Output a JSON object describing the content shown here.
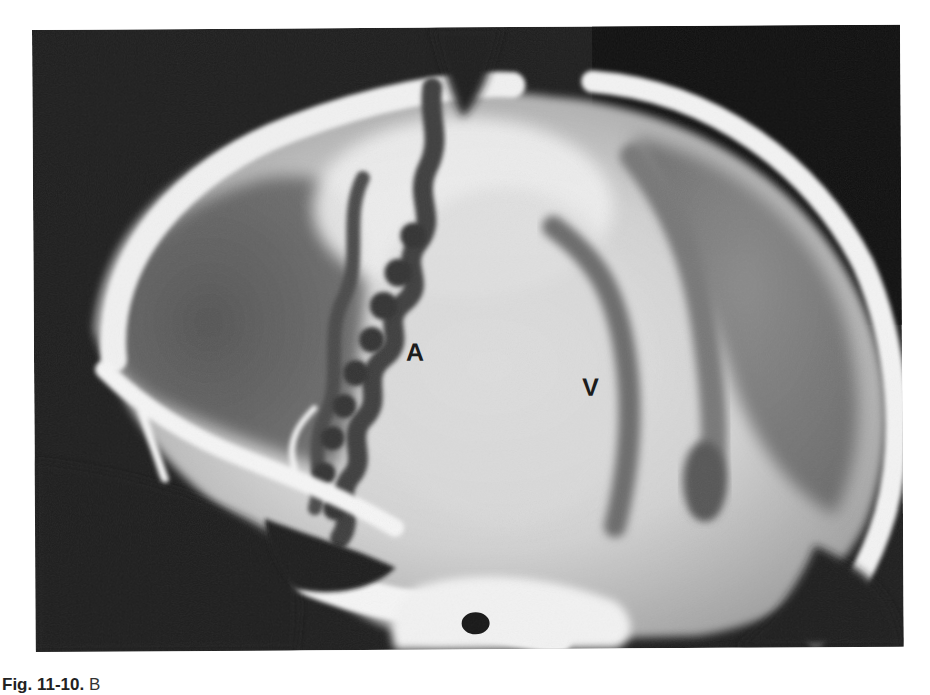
{
  "figure": {
    "type": "lateral skull radiograph (angiogram)",
    "labels": [
      {
        "id": "A",
        "text": "A",
        "x": 372,
        "y": 312
      },
      {
        "id": "V",
        "text": "V",
        "x": 548,
        "y": 348
      }
    ]
  },
  "caption": {
    "figure_number": "Fig. 11-10.",
    "text_visible": "B",
    "truncated": true
  },
  "colors": {
    "film_background": "#1e1e1e",
    "bone": "#f4f4f4",
    "vessel_contrast": "#3a3a3a",
    "brain_field": "#d8d8d8",
    "label_text": "#1c1c1c"
  }
}
